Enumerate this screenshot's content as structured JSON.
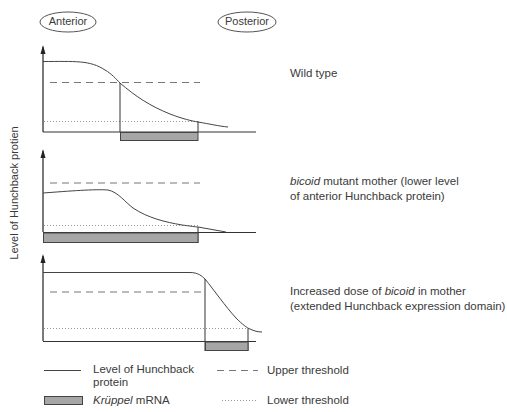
{
  "header": {
    "anterior_label": "Anterior",
    "posterior_label": "Posterior"
  },
  "y_axis_label": "Level of Hunchback protien",
  "panels": [
    {
      "id": "wild-type",
      "caption_line1": "Wild type",
      "caption_line2": ""
    },
    {
      "id": "bicoid-mutant",
      "caption_line1_italic": "bicoid",
      "caption_line1_rest": " mutant mother (lower level",
      "caption_line2": "of anterior Hunchback protein)"
    },
    {
      "id": "increased-bicoid",
      "caption_line1_pre": "Increased dose of ",
      "caption_line1_italic": "bicoid",
      "caption_line1_post": " in mother",
      "caption_line2": "(extended Hunchback expression domain)"
    }
  ],
  "legend": {
    "hunchback_line_label_1": "Level of Hunchback",
    "hunchback_line_label_2": "protein",
    "kruppel_italic": "Krüppel",
    "kruppel_rest": " mRNA",
    "upper_threshold_label": "Upper threshold",
    "lower_threshold_label": "Lower threshold"
  },
  "colors": {
    "line": "#333333",
    "dashed": "#777777",
    "dotted": "#999999",
    "kruppel_fill": "#a6a6a6",
    "kruppel_stroke": "#444444"
  }
}
